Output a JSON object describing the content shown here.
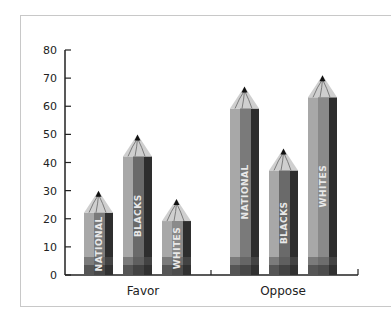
{
  "chart_data": {
    "type": "bar",
    "title": "",
    "xlabel": "",
    "ylabel": "",
    "ylim": [
      0,
      80
    ],
    "yticks": [
      0,
      10,
      20,
      30,
      40,
      50,
      60,
      70,
      80
    ],
    "categories": [
      "Favor",
      "Oppose"
    ],
    "series": [
      {
        "name": "NATIONAL",
        "values": [
          30,
          67
        ]
      },
      {
        "name": "BLACKS",
        "values": [
          50,
          45
        ]
      },
      {
        "name": "WHITES",
        "values": [
          27,
          71
        ]
      }
    ],
    "style": "pencil pictograph, grayscale"
  }
}
